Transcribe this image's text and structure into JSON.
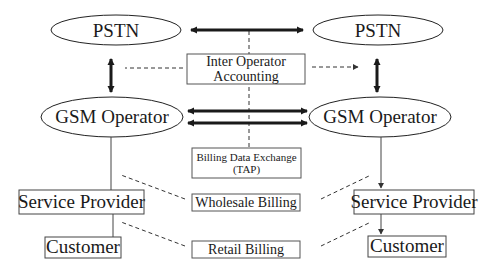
{
  "diagram": {
    "nodes": {
      "pstn_left": {
        "label": "PSTN"
      },
      "pstn_right": {
        "label": "PSTN"
      },
      "gsm_left": {
        "label": "GSM Operator"
      },
      "gsm_right": {
        "label": "GSM Operator"
      },
      "sp_left": {
        "label": "Service Provider"
      },
      "sp_right": {
        "label": "Service Provider"
      },
      "cust_left": {
        "label": "Customer"
      },
      "cust_right": {
        "label": "Customer"
      }
    },
    "processes": {
      "inter_operator": {
        "line1": "Inter Operator",
        "line2": "Accounting"
      },
      "billing_data": {
        "line1": "Billing Data Exchange",
        "line2": "(TAP)"
      },
      "wholesale": {
        "label": "Wholesale Billing"
      },
      "retail": {
        "label": "Retail Billing"
      }
    },
    "colors": {
      "stroke": "#1a1a1a",
      "background": "#ffffff"
    }
  }
}
